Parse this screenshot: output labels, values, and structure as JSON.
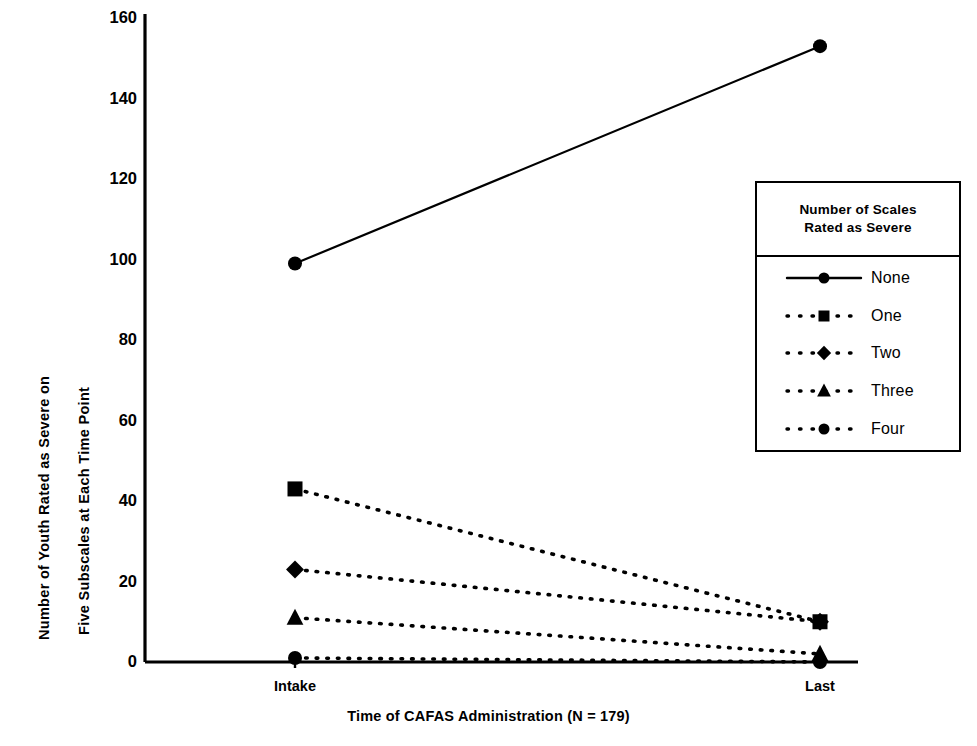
{
  "chart_data": {
    "type": "line",
    "title": "",
    "xlabel": "Time of CAFAS Administration (N = 179)",
    "ylabel": "Number of Youth Rated as Severe on Five Subscales at Each Time Point",
    "ylabel_lines": [
      "Number of Youth Rated as Severe on",
      "Five Subscales at Each Time Point"
    ],
    "categories": [
      "Intake",
      "Last"
    ],
    "xtick_labels": [
      "Intake",
      "Last"
    ],
    "ytick_labels": [
      "0",
      "20",
      "40",
      "60",
      "80",
      "100",
      "120",
      "140",
      "160"
    ],
    "yticks": [
      0,
      20,
      40,
      60,
      80,
      100,
      120,
      140,
      160
    ],
    "ylim": [
      0,
      160
    ],
    "grid": false,
    "legend_position": "right",
    "legend_title": "Number of Scales Rated as Severe",
    "legend_title_lines": [
      "Number of Scales",
      "Rated as Severe"
    ],
    "series": [
      {
        "name": "None",
        "values": [
          99,
          153
        ],
        "marker": "circle",
        "line": "solid",
        "color": "#000000"
      },
      {
        "name": "One",
        "values": [
          43,
          10
        ],
        "marker": "square",
        "line": "dotted",
        "color": "#000000"
      },
      {
        "name": "Two",
        "values": [
          23,
          10
        ],
        "marker": "diamond",
        "line": "dotted",
        "color": "#000000"
      },
      {
        "name": "Three",
        "values": [
          11,
          2
        ],
        "marker": "triangle",
        "line": "dotted",
        "color": "#000000"
      },
      {
        "name": "Four",
        "values": [
          1,
          0
        ],
        "marker": "circle",
        "line": "dotted",
        "color": "#000000"
      }
    ]
  },
  "axis": {
    "x_title": "Time of CAFAS Administration (N = 179)",
    "y_title_line_1": "Number of Youth Rated as Severe on",
    "y_title_line_2": "Five Subscales at Each Time Point",
    "ytick_0": "0",
    "ytick_1": "20",
    "ytick_2": "40",
    "ytick_3": "60",
    "ytick_4": "80",
    "ytick_5": "100",
    "ytick_6": "120",
    "ytick_7": "140",
    "ytick_8": "160",
    "xtick_0": "Intake",
    "xtick_1": "Last"
  },
  "legend": {
    "title_line_1": "Number of Scales",
    "title_line_2": "Rated as Severe",
    "items": [
      {
        "label": "None"
      },
      {
        "label": "One"
      },
      {
        "label": "Two"
      },
      {
        "label": "Three"
      },
      {
        "label": "Four"
      }
    ]
  }
}
